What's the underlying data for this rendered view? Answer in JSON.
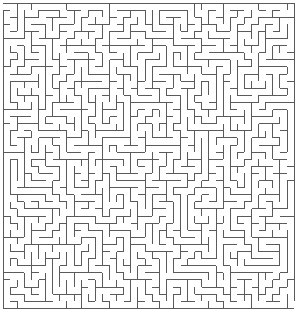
{
  "maze": {
    "cols": 41,
    "rows": 43,
    "cell": 7.1,
    "origin_x": 3,
    "origin_y": 3,
    "wall_color": "#5a5a5a",
    "background": "#ffffff",
    "wall_width": 1,
    "seed": 1337
  }
}
